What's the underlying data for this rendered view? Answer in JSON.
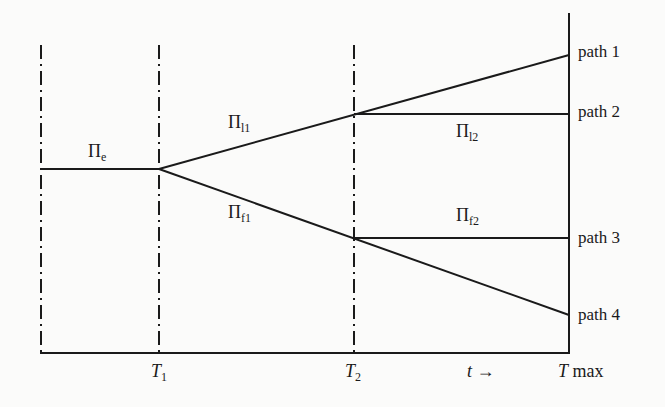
{
  "diagram": {
    "type": "branching path diagram over time",
    "vertical_lines": [
      {
        "name": "start",
        "x": 41,
        "style": "dash-dot"
      },
      {
        "name": "T1",
        "x": 159,
        "style": "dash-dot"
      },
      {
        "name": "T2",
        "x": 354,
        "style": "dash-dot"
      },
      {
        "name": "Tmax",
        "x": 569,
        "style": "solid"
      }
    ],
    "segments": [
      {
        "label": "Πe",
        "from": [
          41,
          169
        ],
        "to": [
          159,
          169
        ]
      },
      {
        "label": "Πl1",
        "from": [
          159,
          169
        ],
        "to": [
          354,
          114
        ]
      },
      {
        "label": "Πl1-cont",
        "from": [
          354,
          114
        ],
        "to": [
          569,
          55
        ]
      },
      {
        "label": "Πl2",
        "from": [
          354,
          114
        ],
        "to": [
          569,
          114
        ]
      },
      {
        "label": "Πf1",
        "from": [
          159,
          169
        ],
        "to": [
          354,
          238
        ]
      },
      {
        "label": "Πf1-cont",
        "from": [
          354,
          238
        ],
        "to": [
          569,
          315
        ]
      },
      {
        "label": "Πf2",
        "from": [
          354,
          238
        ],
        "to": [
          569,
          238
        ]
      }
    ]
  },
  "labels": {
    "pi_e": {
      "base": "Π",
      "sub": "e"
    },
    "pi_l1": {
      "base": "Π",
      "sub": "l1"
    },
    "pi_l2": {
      "base": "Π",
      "sub": "l2"
    },
    "pi_f1": {
      "base": "Π",
      "sub": "f1"
    },
    "pi_f2": {
      "base": "Π",
      "sub": "f2"
    }
  },
  "paths": [
    "path 1",
    "path 2",
    "path 3",
    "path 4"
  ],
  "axis": {
    "t1": {
      "base": "T",
      "sub": "1"
    },
    "t2": {
      "base": "T",
      "sub": "2"
    },
    "t_arrow": "t →",
    "tmax_T": "T",
    "tmax_rest": " max"
  }
}
